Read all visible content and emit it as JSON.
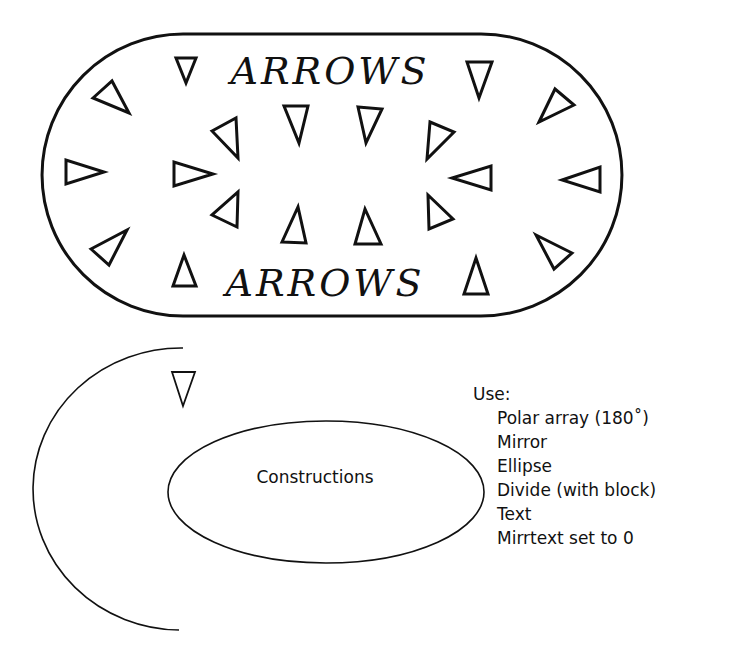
{
  "figure": {
    "top_panel": {
      "title_top": "ARROWS",
      "title_bottom": "ARROWS",
      "shape": "stadium",
      "triangle_count": 20
    },
    "bottom_panel": {
      "ellipse_label": "Constructions",
      "arc": "semicircle-left",
      "triangle_count": 1
    },
    "notes": {
      "heading": "Use:",
      "items": [
        "Polar array (180˚)",
        "Mirror",
        "Ellipse",
        "Divide (with block)",
        "Text",
        "Mirrtext set to 0"
      ]
    },
    "colors": {
      "ink": "#111111",
      "paper": "#ffffff"
    }
  }
}
